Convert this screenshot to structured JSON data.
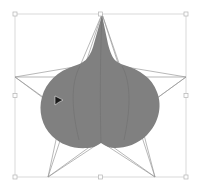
{
  "app": {
    "view_name": "vector-canvas",
    "background_color": "#ffffff",
    "width": 201,
    "height": 194
  },
  "selection": {
    "label": "Selection bounding box",
    "stroke_color": "#c8c8c8",
    "handle_fill": "#fdfdfd",
    "handle_stroke": "#b4b4b4",
    "handle_size": 4,
    "x": 15,
    "y": 14,
    "width": 171,
    "height": 163,
    "handles": [
      {
        "name": "handle-top-left",
        "x": 15,
        "y": 14
      },
      {
        "name": "handle-top-center",
        "x": 100.5,
        "y": 14
      },
      {
        "name": "handle-top-right",
        "x": 186,
        "y": 14
      },
      {
        "name": "handle-middle-left",
        "x": 15,
        "y": 95.5
      },
      {
        "name": "handle-middle-right",
        "x": 186,
        "y": 95.5
      },
      {
        "name": "handle-bottom-left",
        "x": 15,
        "y": 177
      },
      {
        "name": "handle-bottom-center",
        "x": 100.5,
        "y": 177
      },
      {
        "name": "handle-bottom-right",
        "x": 186,
        "y": 177
      }
    ]
  },
  "star": {
    "label": "Star outline path",
    "points": 5,
    "stroke_color": "#9a9a9a",
    "stroke_width": 0.7,
    "fill": "none",
    "vertices": [
      {
        "name": "star-point-top",
        "x": 102,
        "y": 14
      },
      {
        "name": "star-inner-upper-right",
        "x": 120,
        "y": 66
      },
      {
        "name": "star-point-right",
        "x": 186,
        "y": 77
      },
      {
        "name": "star-inner-lower-right",
        "x": 138,
        "y": 112
      },
      {
        "name": "star-point-bottom-right",
        "x": 155,
        "y": 177
      },
      {
        "name": "star-inner-bottom",
        "x": 101,
        "y": 142
      },
      {
        "name": "star-point-bottom-left",
        "x": 48,
        "y": 177
      },
      {
        "name": "star-inner-lower-left",
        "x": 62,
        "y": 112
      },
      {
        "name": "star-point-left",
        "x": 15,
        "y": 77
      },
      {
        "name": "star-inner-upper-left",
        "x": 80,
        "y": 66
      }
    ],
    "chords": [
      {
        "name": "star-chord-left-right",
        "x1": 15,
        "y1": 77,
        "x2": 186,
        "y2": 77
      },
      {
        "name": "star-chord-top-bl",
        "x1": 102,
        "y1": 14,
        "x2": 48,
        "y2": 177
      },
      {
        "name": "star-chord-top-br",
        "x1": 102,
        "y1": 14,
        "x2": 155,
        "y2": 177
      },
      {
        "name": "star-chord-left-br",
        "x1": 15,
        "y1": 77,
        "x2": 155,
        "y2": 177
      },
      {
        "name": "star-chord-right-bl",
        "x1": 186,
        "y1": 77,
        "x2": 48,
        "y2": 177
      }
    ]
  },
  "blob": {
    "label": "Deformed blob shape",
    "fill_color": "#808080",
    "stroke": "none",
    "seam_color": "#747474",
    "path": "M 102 15 L 108 44 C 112 60 116 62 124 65 C 140 70 152 78 157 92 C 163 107 158 124 147 135 C 138 144 126 148 115 148 C 110 148 105 146 101 143 C 97 146 92 148 87 148 C 74 149 61 145 52 136 C 42 126 38 111 42 97 C 46 82 58 71 74 66 C 84 63 89 59 93 47 L 102 15 Z",
    "lobes": [
      {
        "name": "blob-lobe-top-spike",
        "cx": 102,
        "cy": 32
      },
      {
        "name": "blob-lobe-left",
        "cx": 55,
        "cy": 104
      },
      {
        "name": "blob-lobe-right",
        "cx": 148,
        "cy": 104
      },
      {
        "name": "blob-lobe-bottom-left",
        "cx": 78,
        "cy": 140
      },
      {
        "name": "blob-lobe-bottom-right",
        "cx": 126,
        "cy": 140
      }
    ]
  },
  "cursor": {
    "label": "Mouse pointer",
    "icon": "arrow-cursor-icon",
    "color": "#1a1a1a",
    "x": 55,
    "y": 96,
    "width": 8,
    "height": 9
  }
}
